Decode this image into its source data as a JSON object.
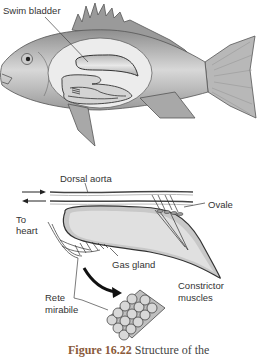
{
  "labels": {
    "swim_bladder": "Swim bladder",
    "dorsal_aorta": "Dorsal aorta",
    "ovale": "Ovale",
    "to_heart": "To\nheart",
    "to_heart_line1": "To",
    "to_heart_line2": "heart",
    "gas_gland": "Gas gland",
    "constrictor_line1": "Constrictor",
    "constrictor_line2": "muscles",
    "rete_line1": "Rete",
    "rete_line2": "mirabile"
  },
  "caption": {
    "figure_number": "Figure 16.22",
    "text": "Structure of the"
  }
}
